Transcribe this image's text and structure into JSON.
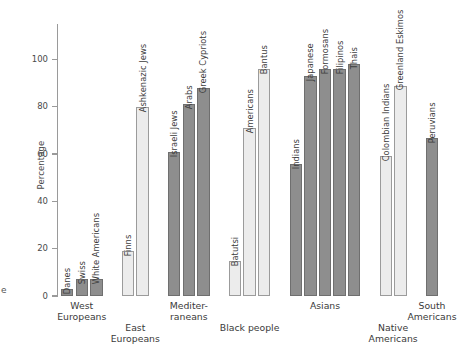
{
  "edge_glyph": "e",
  "chart_data": {
    "type": "bar",
    "title": "",
    "xlabel": "",
    "ylabel": "Percentage",
    "ylim": [
      0,
      115
    ],
    "yticks": [
      0,
      20,
      40,
      60,
      80,
      100
    ],
    "ytick_labels": [
      "0",
      "20",
      "40",
      "60",
      "80",
      "100"
    ],
    "grid": false,
    "legend": "none",
    "categories": [
      "Danes",
      "Swiss",
      "White Americans",
      "Finns",
      "Ashkenazic Jews",
      "Israeli Jews",
      "Arabs",
      "Greek Cypriots",
      "Batutsi",
      "Americans",
      "Bantus",
      "Indians",
      "Japanese",
      "Formosans",
      "Filipinos",
      "Thais",
      "Colombian Indians",
      "Greenland Eskimos",
      "Peruvians"
    ],
    "values": [
      3,
      7,
      7,
      19,
      80,
      61,
      81,
      88,
      15,
      71,
      96,
      56,
      93,
      96,
      96,
      98,
      59,
      89,
      67
    ],
    "bars": [
      {
        "label": "Danes",
        "value": 3,
        "shade": "dark",
        "group": "West Europeans"
      },
      {
        "label": "Swiss",
        "value": 7,
        "shade": "dark",
        "group": "West Europeans"
      },
      {
        "label": "White Americans",
        "value": 7,
        "shade": "dark",
        "group": "West Europeans"
      },
      {
        "label": "Finns",
        "value": 19,
        "shade": "light",
        "group": "East Europeans"
      },
      {
        "label": "Ashkenazic Jews",
        "value": 80,
        "shade": "light",
        "group": "East Europeans"
      },
      {
        "label": "Israeli Jews",
        "value": 61,
        "shade": "dark",
        "group": "Mediterraneans"
      },
      {
        "label": "Arabs",
        "value": 81,
        "shade": "dark",
        "group": "Mediterraneans"
      },
      {
        "label": "Greek Cypriots",
        "value": 88,
        "shade": "dark",
        "group": "Mediterraneans"
      },
      {
        "label": "Batutsi",
        "value": 15,
        "shade": "light",
        "group": "Black people"
      },
      {
        "label": "Americans",
        "value": 71,
        "shade": "light",
        "group": "Black people"
      },
      {
        "label": "Bantus",
        "value": 96,
        "shade": "light",
        "group": "Black people"
      },
      {
        "label": "Indians",
        "value": 56,
        "shade": "dark",
        "group": "Asians"
      },
      {
        "label": "Japanese",
        "value": 93,
        "shade": "dark",
        "group": "Asians"
      },
      {
        "label": "Formosans",
        "value": 96,
        "shade": "dark",
        "group": "Asians"
      },
      {
        "label": "Filipinos",
        "value": 96,
        "shade": "dark",
        "group": "Asians"
      },
      {
        "label": "Thais",
        "value": 98,
        "shade": "dark",
        "group": "Asians"
      },
      {
        "label": "Colombian Indians",
        "value": 59,
        "shade": "light",
        "group": "Native Americans"
      },
      {
        "label": "Greenland Eskimos",
        "value": 89,
        "shade": "light",
        "group": "Native Americans"
      },
      {
        "label": "Peruvians",
        "value": 67,
        "shade": "dark",
        "group": "South Americans"
      }
    ],
    "groups": [
      {
        "name": "West Europeans",
        "label": "West\nEuropeans",
        "row": 0
      },
      {
        "name": "East Europeans",
        "label": "East\nEuropeans",
        "row": 1
      },
      {
        "name": "Mediterraneans",
        "label": "Mediter-\nraneans",
        "row": 0
      },
      {
        "name": "Black people",
        "label": "Black people",
        "row": 1
      },
      {
        "name": "Asians",
        "label": "Asians",
        "row": 0
      },
      {
        "name": "Native Americans",
        "label": "Native\nAmericans",
        "row": 1
      },
      {
        "name": "South Americans",
        "label": "South\nAmericans",
        "row": 0
      }
    ],
    "colors": {
      "light_bar": "#ececec",
      "dark_bar": "#8e8e8e",
      "bar_outline": "#9b9b9b",
      "axis": "#9a9a9a",
      "text": "#3a3a3a",
      "background": "#ffffff"
    }
  }
}
